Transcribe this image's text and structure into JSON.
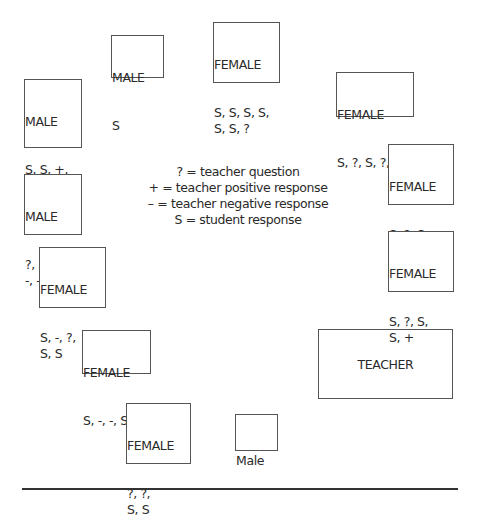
{
  "diagram": {
    "seats": [
      {
        "label": "MALE",
        "codes": "S"
      },
      {
        "label": "FEMALE",
        "codes": "S, S, S, S,\nS, S, ?"
      },
      {
        "label": "MALE",
        "codes": "S, S, +,\n?, S, +,\n?, +, +"
      },
      {
        "label": "FEMALE",
        "codes": "S, ?, S, ?, +"
      },
      {
        "label": "MALE",
        "codes": "?, ?, -,\n-, -, ?"
      },
      {
        "label": "FEMALE",
        "codes": "S, ?, S,\nS, +"
      },
      {
        "label": "FEMALE",
        "codes": "S, -, ?,\nS, S"
      },
      {
        "label": "FEMALE",
        "codes": "S, ?, S,\nS, +"
      },
      {
        "label": "FEMALE",
        "codes": "S, -, -, S"
      },
      {
        "label": "FEMALE",
        "codes": "?, ?,\nS, S"
      },
      {
        "label": "Male",
        "codes": ""
      }
    ],
    "teacher": {
      "label": "TEACHER"
    },
    "legend": [
      "? = teacher question",
      "+ = teacher positive response",
      "– = teacher negative response",
      "S = student response"
    ]
  }
}
